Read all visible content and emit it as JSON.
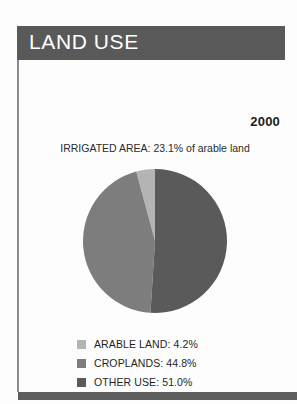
{
  "panel": {
    "title": "LAND USE",
    "year": "2000",
    "irrigated_note": "IRRIGATED AREA: 23.1% of arable land",
    "header_color": "#595959",
    "footer_color": "#5e5e5e",
    "border_color": "#8a8a8a"
  },
  "chart_data": {
    "type": "pie",
    "title": "LAND USE",
    "subtitle": "IRRIGATED AREA: 23.1% of arable land",
    "year": "2000",
    "categories": [
      "ARABLE LAND",
      "CROPLANDS",
      "OTHER USE"
    ],
    "values": [
      4.2,
      44.8,
      51.0
    ],
    "unit": "%",
    "labels": [
      "ARABLE LAND: 4.2%",
      "CROPLANDS: 44.8%",
      "OTHER USE: 51.0%"
    ],
    "colors": [
      "#b4b4b4",
      "#7d7d7d",
      "#5a5a5a"
    ],
    "legend_position": "bottom-left",
    "start_angle_deg": 0,
    "direction": "counter-clockwise",
    "grid": false
  },
  "legend": {
    "items": [
      {
        "label": "ARABLE LAND: 4.2%",
        "color": "#b4b4b4",
        "value": 4.2
      },
      {
        "label": "CROPLANDS: 44.8%",
        "color": "#7d7d7d",
        "value": 44.8
      },
      {
        "label": "OTHER USE: 51.0%",
        "color": "#5a5a5a",
        "value": 51.0
      }
    ]
  }
}
